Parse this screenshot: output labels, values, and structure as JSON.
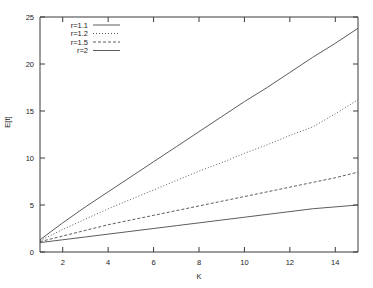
{
  "chart_data": {
    "type": "line",
    "title": "",
    "xlabel": "K",
    "ylabel": "E[t]",
    "xlim": [
      1,
      15
    ],
    "ylim": [
      0,
      25
    ],
    "grid": false,
    "legend_position": "top-left",
    "xticks": [
      2,
      4,
      6,
      8,
      10,
      12,
      14
    ],
    "yticks": [
      0,
      5,
      10,
      15,
      20,
      25
    ],
    "x": [
      1,
      2,
      3,
      4,
      5,
      6,
      7,
      8,
      9,
      10,
      11,
      12,
      13,
      14,
      15
    ],
    "series": [
      {
        "name": "r=1.1",
        "style": "solid",
        "values": [
          1.3,
          3.1,
          4.8,
          6.4,
          8.0,
          9.6,
          11.2,
          12.8,
          14.4,
          16.0,
          17.5,
          19.1,
          20.7,
          22.2,
          23.8
        ]
      },
      {
        "name": "r=1.2",
        "style": "dotted",
        "values": [
          1.2,
          2.4,
          3.5,
          4.6,
          5.6,
          6.6,
          7.6,
          8.6,
          9.5,
          10.5,
          11.4,
          12.4,
          13.3,
          14.7,
          16.2
        ]
      },
      {
        "name": "r=1.5",
        "style": "dashed",
        "values": [
          1.1,
          1.7,
          2.3,
          2.9,
          3.4,
          3.9,
          4.4,
          4.9,
          5.4,
          5.9,
          6.4,
          6.9,
          7.4,
          7.9,
          8.5
        ]
      },
      {
        "name": "r=2",
        "style": "solid",
        "values": [
          1.0,
          1.3,
          1.6,
          1.9,
          2.2,
          2.5,
          2.8,
          3.1,
          3.4,
          3.7,
          4.0,
          4.3,
          4.6,
          4.8,
          5.0
        ]
      }
    ]
  }
}
